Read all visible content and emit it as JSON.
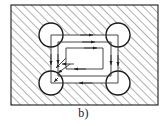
{
  "figure": {
    "caption": "b)",
    "label_id": "figure-label-b",
    "type": "engineering-cross-section-diagram",
    "colors": {
      "outline": "#1a1a1a",
      "hatch": "#555555",
      "path": "#333333",
      "arrow": "#222222",
      "background": "#ffffff",
      "circle_fill": "#ffffff"
    },
    "outer_boundary": {
      "name": "hatched-material-boundary",
      "x": 11,
      "y": 5,
      "width": 147,
      "height": 100,
      "hatch_angle_deg": 45,
      "hatch_spacing_px": 6
    },
    "corner_circles": [
      {
        "name": "corner-circle-top-left",
        "cx": 51,
        "cy": 35,
        "r": 12
      },
      {
        "name": "corner-circle-top-right",
        "cx": 118,
        "cy": 35,
        "r": 12
      },
      {
        "name": "corner-circle-bottom-left",
        "cx": 51,
        "cy": 83,
        "r": 12
      },
      {
        "name": "corner-circle-bottom-right",
        "cx": 118,
        "cy": 83,
        "r": 12
      }
    ],
    "path_loops": [
      {
        "name": "path-loop-outer",
        "x": 51,
        "y": 35,
        "width": 67,
        "height": 48,
        "direction": "clockwise",
        "arrows": [
          "top-right",
          "right-down",
          "bottom-left",
          "left-down"
        ]
      },
      {
        "name": "path-loop-middle",
        "x": 58,
        "y": 42,
        "width": 53,
        "height": 34,
        "direction": "clockwise",
        "arrows": [
          "top-right",
          "right-down",
          "bottom-left",
          "left-down"
        ]
      },
      {
        "name": "path-loop-inner",
        "x": 66,
        "y": 48,
        "width": 37,
        "height": 21,
        "direction": "clockwise",
        "arrows": [
          "top-right",
          "bottom-left"
        ]
      }
    ],
    "connector_arrows": [
      {
        "name": "connector-arrow-to-bottom-left-1",
        "points": "63,57 54,66"
      },
      {
        "name": "connector-arrow-to-bottom-left-2",
        "points": "66,62 56,72"
      }
    ],
    "arrow_count_total": 12
  }
}
